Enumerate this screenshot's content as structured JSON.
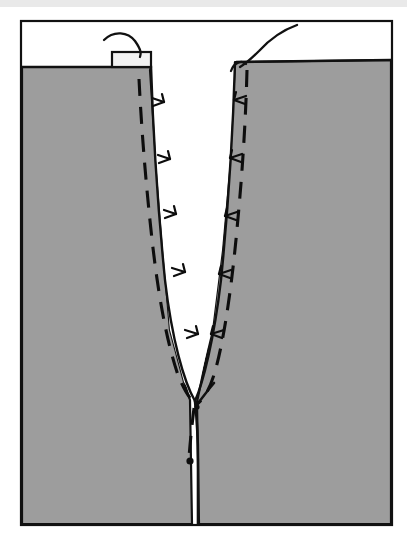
{
  "figure": {
    "title": "Sewing construction diagram: clipped and stitched V notch",
    "background_color": "#ffffff",
    "fabric_color": "#9d9d9d",
    "ink_color": "#0d0d0d",
    "notch_color": "#ffffff",
    "top_strip_color": "#e9e9e9"
  },
  "frame": {
    "x": 20,
    "y": 20,
    "width": 373,
    "height": 506,
    "stroke_width": 2,
    "stroke_color": "#111111"
  },
  "fabric": {
    "label": "fabric-panel",
    "top_edge_left_y": 67,
    "top_edge_right_y": 60,
    "outline_path": "M 22,67 L 150,67 L 163,341 L 186,404 L 187,524 L 22,524 Z"
  },
  "notch": {
    "label": "v-notch-cutout",
    "apex_x": 195,
    "apex_y": 398,
    "left_top_x": 152,
    "right_top_x": 232,
    "top_y": 64
  },
  "stitch_lines": [
    {
      "name": "left-stitch-line",
      "dash": "16 11",
      "points": "140,80 146,160 155,250 166,330 180,378 196,404"
    },
    {
      "name": "right-stitch-line",
      "dash": "16 11",
      "points": "248,70 243,140 238,210 232,280 226,340 218,380 204,404"
    },
    {
      "name": "center-dashed-tail",
      "dash": "16 11",
      "points": "196,410 194,440 192,470"
    }
  ],
  "center_seam": {
    "name": "center-seam-line",
    "points": "196,404 198,450 198,524"
  },
  "fork": {
    "name": "seam-fork-branch",
    "points": "196,406 212,384"
  },
  "clip_marks_left": [
    {
      "x": 160,
      "y": 101
    },
    {
      "x": 166,
      "y": 158
    },
    {
      "x": 172,
      "y": 213
    },
    {
      "x": 180,
      "y": 273
    },
    {
      "x": 192,
      "y": 336
    }
  ],
  "clip_marks_right": [
    {
      "x": 240,
      "y": 100
    },
    {
      "x": 236,
      "y": 158
    },
    {
      "x": 231,
      "y": 217
    },
    {
      "x": 226,
      "y": 275
    },
    {
      "x": 219,
      "y": 334
    }
  ],
  "tab": {
    "name": "fabric-tab",
    "x": 112,
    "y": 53,
    "width": 38,
    "height": 14
  },
  "threads": [
    {
      "name": "left-thread",
      "path": "M 106,41 C 116,32 130,34 136,42 C 142,50 142,52 141,56"
    },
    {
      "name": "right-thread",
      "path": "M 295,26 C 281,31 268,41 258,52 C 250,60 244,64 239,66"
    },
    {
      "name": "right-thread-knot",
      "path": "M 232,68 C 236,62 243,61 246,65"
    }
  ],
  "dot": {
    "name": "dot-marking",
    "x": 190,
    "y": 461,
    "r": 3.4
  },
  "fork_dot": {
    "name": "fork-junction-dot",
    "x": 197,
    "y": 407,
    "r": 2.6
  }
}
